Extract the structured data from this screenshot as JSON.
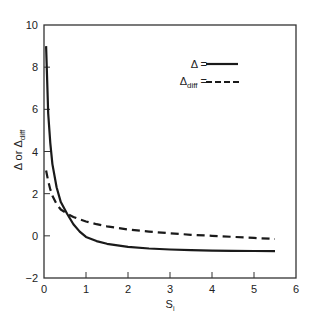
{
  "chart_data": {
    "type": "line",
    "title": "",
    "xlabel": "S",
    "xlabel_sub": "i",
    "ylabel": "Δ or Δ",
    "ylabel_sub": "diff",
    "xlim": [
      0,
      6
    ],
    "ylim": [
      -2,
      10
    ],
    "xticks": [
      0,
      1,
      2,
      3,
      4,
      5,
      6
    ],
    "yticks": [
      -2,
      0,
      2,
      4,
      6,
      8,
      10
    ],
    "xtick_labels": [
      "0",
      "1",
      "2",
      "3",
      "4",
      "5",
      "6"
    ],
    "ytick_labels": [
      "−2",
      "0",
      "2",
      "4",
      "6",
      "8",
      "10"
    ],
    "grid": false,
    "legend_position": "upper right",
    "series": [
      {
        "name": "Δ",
        "style": "solid",
        "x": [
          0.05,
          0.1,
          0.15,
          0.2,
          0.3,
          0.4,
          0.55,
          0.7,
          0.85,
          1.0,
          1.25,
          1.5,
          2.0,
          2.5,
          3.0,
          3.5,
          4.0,
          4.5,
          5.0,
          5.5
        ],
        "y": [
          9.0,
          5.8,
          4.4,
          3.4,
          2.3,
          1.6,
          1.05,
          0.55,
          0.2,
          -0.05,
          -0.25,
          -0.38,
          -0.52,
          -0.6,
          -0.65,
          -0.68,
          -0.7,
          -0.71,
          -0.72,
          -0.73
        ]
      },
      {
        "name": "Δdiff",
        "style": "dashed",
        "x": [
          0.05,
          0.1,
          0.15,
          0.2,
          0.3,
          0.4,
          0.55,
          0.7,
          0.85,
          1.0,
          1.25,
          1.5,
          2.0,
          2.5,
          3.0,
          3.5,
          4.0,
          4.5,
          5.0,
          5.5
        ],
        "y": [
          3.1,
          2.6,
          2.2,
          1.9,
          1.5,
          1.25,
          1.05,
          0.9,
          0.78,
          0.68,
          0.55,
          0.45,
          0.3,
          0.2,
          0.12,
          0.05,
          0.0,
          -0.05,
          -0.1,
          -0.15
        ]
      }
    ]
  },
  "legend": {
    "items": [
      {
        "label": "Δ",
        "sub": "",
        "suffix": " =",
        "style": "solid"
      },
      {
        "label": "Δ",
        "sub": "diff",
        "suffix": " =",
        "style": "dashed"
      }
    ]
  },
  "colors": {
    "line": "#1a1a1a",
    "axis": "#333333",
    "background": "#ffffff"
  }
}
